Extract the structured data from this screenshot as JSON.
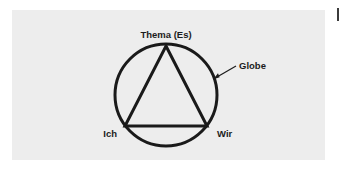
{
  "figure": {
    "background_color": "#ffffff",
    "panel_color": "#ededed",
    "stroke_color": "#1a1a1a",
    "text_color": "#1c1c1c",
    "labels": {
      "apex": "Thema (Es)",
      "bottom_left": "Ich",
      "bottom_right": "Wir",
      "circle_callout": "Globe"
    },
    "shapes": {
      "circle": {
        "cx": 166,
        "cy": 95,
        "r": 51,
        "stroke_width": 3
      },
      "triangle": {
        "points": "166,46 207,126 125,126",
        "stroke_width": 3
      },
      "callout_line": {
        "x1": 215,
        "y1": 78,
        "x2": 236,
        "y2": 66
      }
    }
  }
}
